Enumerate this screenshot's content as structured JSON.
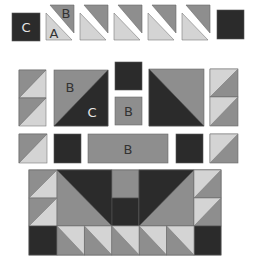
{
  "diagram": {
    "type": "quilt-block-piecing-diagram",
    "colors": {
      "dark": "#2b2b2b",
      "medium": "#8e8e8e",
      "light": "#d4d4d4",
      "stroke": "#6a6a6a",
      "label_light": "#e6e6e6",
      "label_dark": "#333333"
    },
    "labels": {
      "c_square": "C",
      "hst_b": "B",
      "hst_a": "A",
      "big_b": "B",
      "big_c": "C",
      "small_b": "B",
      "strip_b": "B"
    },
    "rows": [
      {
        "name": "top-row",
        "pieces": [
          "C square",
          "split HST A/B",
          "split HST",
          "split HST",
          "split HST",
          "split HST",
          "dark square"
        ]
      },
      {
        "name": "middle-row",
        "pieces": [
          "2 stacked HSTs",
          "large HST B/C",
          "dark square",
          "B square",
          "large HST dark/medium",
          "2 stacked HSTs"
        ]
      },
      {
        "name": "strip-row",
        "pieces": [
          "HST",
          "dark square",
          "B rectangle",
          "dark square",
          "HST"
        ]
      },
      {
        "name": "assembled-block",
        "pieces": [
          "assembled quilt block"
        ]
      }
    ]
  }
}
